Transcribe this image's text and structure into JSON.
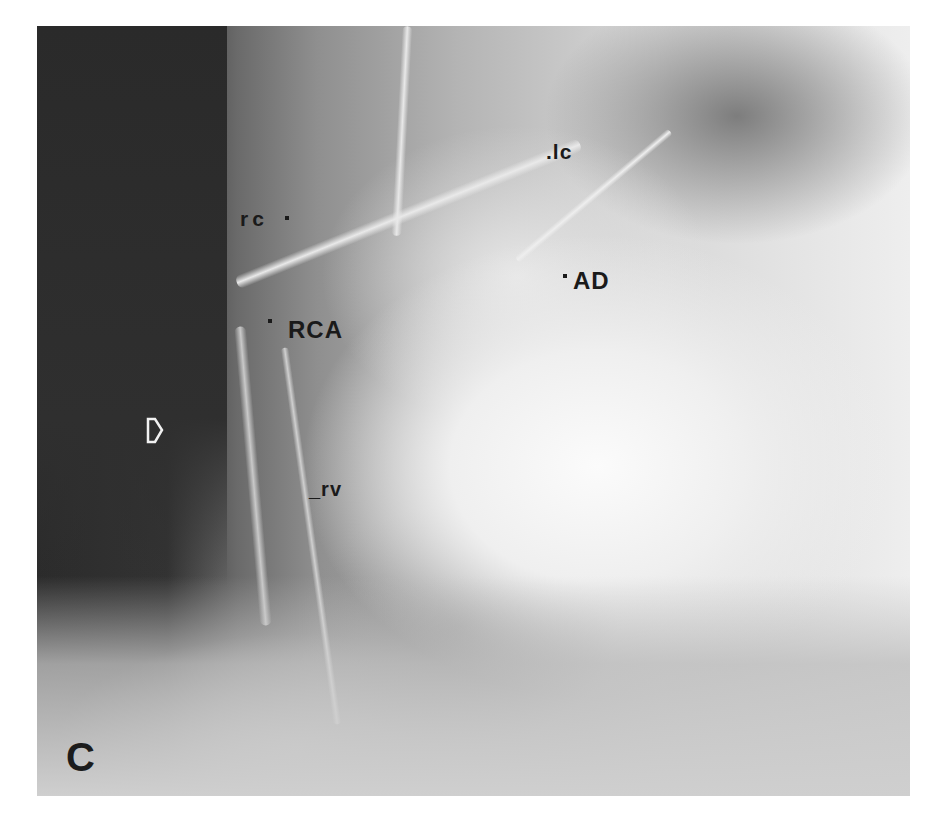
{
  "figure": {
    "panel_label": "C",
    "image_type": "coronary angiogram (grayscale x-ray)",
    "annotations": [
      {
        "id": "lc",
        "text": ".lc"
      },
      {
        "id": "rc",
        "text": "rc"
      },
      {
        "id": "ad",
        "text": "AD"
      },
      {
        "id": "rca",
        "text": "RCA"
      },
      {
        "id": "rv",
        "text": "_rv"
      }
    ],
    "marker": {
      "type": "open-arrow",
      "direction": "right"
    }
  }
}
